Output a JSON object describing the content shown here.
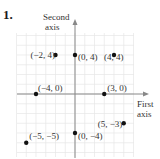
{
  "problem_number": "1.",
  "chart_data": {
    "type": "scatter",
    "title": "",
    "xlabel": "First axis",
    "ylabel": "Second axis",
    "xlim": [
      -6,
      6
    ],
    "ylim": [
      -6,
      6
    ],
    "grid": true,
    "points": [
      {
        "x": -2,
        "y": 4,
        "label": "(−2, 4)"
      },
      {
        "x": 0,
        "y": 4,
        "label": "(0, 4)"
      },
      {
        "x": 4,
        "y": 4,
        "label": "(4, 4)"
      },
      {
        "x": -4,
        "y": 0,
        "label": "(−4, 0)"
      },
      {
        "x": 3,
        "y": 0,
        "label": "(3, 0)"
      },
      {
        "x": 5,
        "y": -3,
        "label": "(5, −3)"
      },
      {
        "x": -5,
        "y": -5,
        "label": "(−5, −5)"
      },
      {
        "x": 0,
        "y": -4,
        "label": "(0, −4)"
      }
    ]
  },
  "axes": {
    "x_label_line1": "First",
    "x_label_line2": "axis",
    "y_label_line1": "Second",
    "y_label_line2": "axis"
  }
}
